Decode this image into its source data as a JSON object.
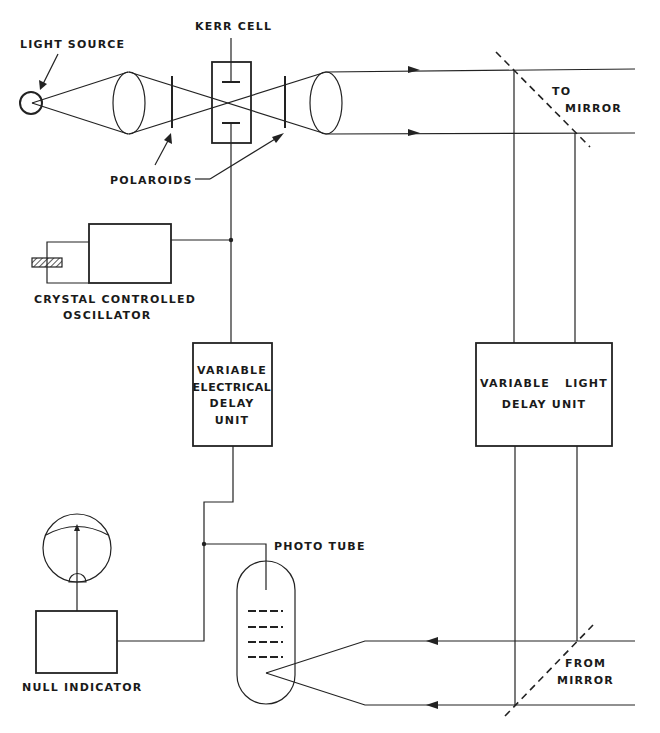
{
  "diagram": {
    "labels": {
      "light_source": "LIGHT SOURCE",
      "kerr_cell": "KERR CELL",
      "polaroids": "POLAROIDS",
      "to_mirror_1": "TO",
      "to_mirror_2": "MIRROR",
      "oscillator_1": "CRYSTAL CONTROLLED",
      "oscillator_2": "OSCILLATOR",
      "elec_delay_1": "VARIABLE",
      "elec_delay_2": "ELECTRICAL",
      "elec_delay_3": "DELAY",
      "elec_delay_4": "UNIT",
      "light_delay_1": "VARIABLE   LIGHT",
      "light_delay_2": "DELAY UNIT",
      "photo_tube": "PHOTO TUBE",
      "null_indicator": "NULL INDICATOR",
      "from_mirror_1": "FROM",
      "from_mirror_2": "MIRROR"
    },
    "components": [
      "light-source",
      "lens",
      "polaroid",
      "kerr-cell",
      "polaroid",
      "lens",
      "beam-splitter-out",
      "crystal-controlled-oscillator",
      "variable-electrical-delay-unit",
      "variable-light-delay-unit",
      "photo-tube",
      "null-indicator",
      "beam-splitter-in"
    ]
  }
}
